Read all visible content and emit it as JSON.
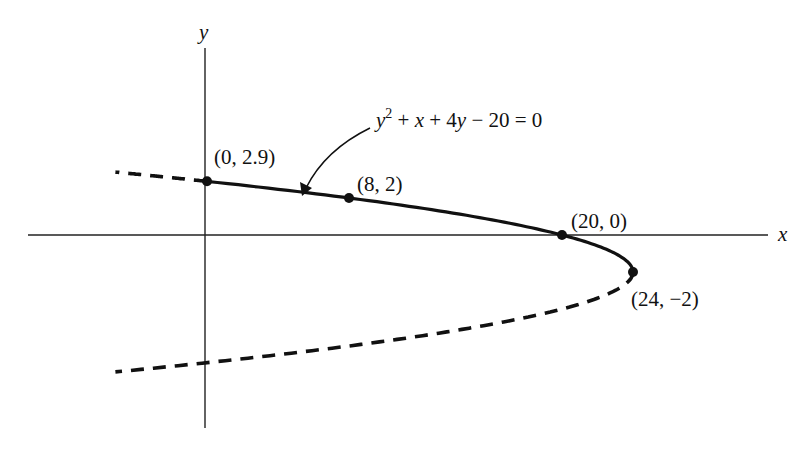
{
  "chart_data": {
    "type": "line",
    "title": "",
    "xlabel": "x",
    "ylabel": "y",
    "equation": "y^2 + x + 4y - 20 = 0",
    "equation_parts": {
      "y": "y",
      "sq": "2",
      "rest1": " + ",
      "x": "x",
      "rest2": " + 4",
      "y2": "y",
      "rest3": " − 20 = 0"
    },
    "curve": {
      "kind": "parabola",
      "form": "x = 24 - (y + 2)^2",
      "vertex": [
        24,
        -2
      ],
      "solid_segment_y_range": [
        -2,
        2.9
      ],
      "dashed_segments_y_range": [
        [
          2.9,
          3.4
        ],
        [
          -7.4,
          -2
        ]
      ]
    },
    "points": [
      {
        "label": "(0, 2.9)",
        "x": 0,
        "y": 2.9
      },
      {
        "label": "(8, 2)",
        "x": 8,
        "y": 2
      },
      {
        "label": "(20, 0)",
        "x": 20,
        "y": 0
      },
      {
        "label": "(24, −2)",
        "x": 24,
        "y": -2
      }
    ],
    "xlim": [
      -10,
      32
    ],
    "ylim": [
      -10,
      12
    ],
    "grid": false,
    "legend": null,
    "annotations": [
      {
        "text": "y^2 + x + 4y - 20 = 0",
        "arrow_to": "curve near (6, 2.2)"
      }
    ]
  },
  "labels": {
    "x_axis": "x",
    "y_axis": "y",
    "p0": "(0, 2.9)",
    "p1": "(8, 2)",
    "p2": "(20, 0)",
    "p3": "(24, −2)"
  }
}
